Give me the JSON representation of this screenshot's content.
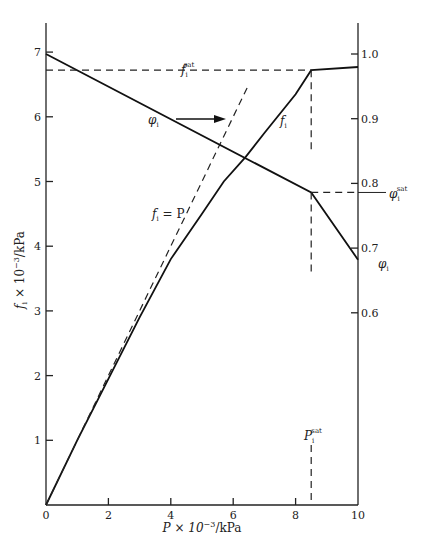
{
  "chart_data": {
    "type": "line",
    "title": "",
    "xlabel": "P × 10⁻³/kPa",
    "ylabel": "f_i × 10⁻³/kPa",
    "y2label": "φ_i",
    "xlim": [
      0,
      10
    ],
    "ylim": [
      0,
      7.5
    ],
    "y2lim": [
      0.3,
      1.05
    ],
    "x_ticks": [
      "0",
      "2",
      "4",
      "6",
      "8",
      "10"
    ],
    "y_ticks": [
      "1",
      "2",
      "3",
      "4",
      "5",
      "6",
      "7"
    ],
    "y2_ticks": [
      "0.6",
      "0.7",
      "0.8",
      "0.9",
      "1.0"
    ],
    "grid": false,
    "series": [
      {
        "name": "f_i",
        "axis": "left",
        "style": "solid",
        "x": [
          0,
          1,
          2,
          3,
          4,
          5,
          5.7,
          6.4,
          7,
          8,
          8.5,
          10
        ],
        "y": [
          0,
          1.0,
          1.95,
          2.9,
          3.8,
          4.5,
          5.0,
          5.38,
          5.75,
          6.35,
          6.72,
          6.77
        ]
      },
      {
        "name": "f_i = P",
        "axis": "left",
        "style": "dashed",
        "x": [
          0,
          6.5
        ],
        "y": [
          0,
          6.5
        ]
      },
      {
        "name": "φ_i",
        "axis": "right",
        "style": "solid",
        "x": [
          0,
          8.5,
          10
        ],
        "y": [
          1.0,
          0.786,
          0.682
        ]
      }
    ],
    "reference_lines": {
      "f_sat": 6.72,
      "phi_sat": 0.786,
      "P_sat": 8.5
    },
    "annotations": [
      {
        "text": "f_i^sat",
        "main": "f",
        "sub": "i",
        "sup": "sat"
      },
      {
        "text": "φ_i",
        "main": "φ",
        "sub": "i",
        "arrow": "right"
      },
      {
        "text": "f_i",
        "main": "f",
        "sub": "i"
      },
      {
        "text": "f_i = P",
        "main": "f",
        "sub": "i",
        "rest": " = P"
      },
      {
        "text": "φ_i^sat",
        "main": "φ",
        "sub": "i",
        "sup": "sat"
      },
      {
        "text": "φ_i",
        "main": "φ",
        "sub": "i"
      },
      {
        "text": "P_i^sat",
        "main": "P",
        "sub": "i",
        "sup": "sat"
      }
    ]
  },
  "labels": {
    "xlabel_main": "P × 10",
    "xlabel_exp": "−3",
    "xlabel_unit": "/kPa",
    "ylabel_main": "f",
    "ylabel_sub": "i",
    "ylabel_mid": " × 10",
    "ylabel_exp": "−3",
    "ylabel_unit": "/kPa",
    "sub_i": "i",
    "sup_sat": "sat",
    "f": "f",
    "phi": "φ",
    "P": "P",
    "eqP": " = P"
  }
}
